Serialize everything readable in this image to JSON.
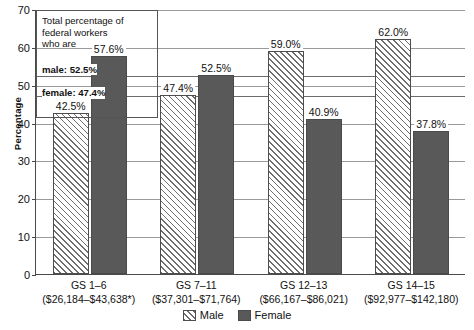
{
  "chart_data": {
    "type": "bar",
    "title": "",
    "xlabel": "",
    "ylabel": "Percentage",
    "ylim": [
      0,
      70
    ],
    "ytick_step": 10,
    "yticks": [
      0,
      10,
      20,
      30,
      40,
      50,
      60,
      70
    ],
    "grid": true,
    "legend_position": "bottom-center",
    "categories": [
      "GS 1–6",
      "GS 7–11",
      "GS 12–13",
      "GS 14–15"
    ],
    "category_sublabels": [
      "($26,184–$43,638*)",
      "($37,301–$71,764)",
      "($66,167–$86,021)",
      "($92,977–$142,180)"
    ],
    "series": [
      {
        "name": "Male",
        "values": [
          42.5,
          47.4,
          59.0,
          62.0
        ],
        "labels": [
          "42.5%",
          "47.4%",
          "59.0%",
          "62.0%"
        ],
        "color": "#ffffff",
        "pattern": "diagonal-hatch"
      },
      {
        "name": "Female",
        "values": [
          57.6,
          52.5,
          40.9,
          37.8
        ],
        "labels": [
          "57.6%",
          "52.5%",
          "40.9%",
          "37.8%"
        ],
        "color": "#595959",
        "pattern": "solid"
      }
    ],
    "reference_lines": [
      {
        "name": "male-total",
        "value": 52.5,
        "label": "male: 52.5%"
      },
      {
        "name": "female-total",
        "value": 47.4,
        "label": "female: 47.4%"
      }
    ],
    "annotation": {
      "line1": "Total percentage of",
      "line2": "federal workers",
      "line3": "who are",
      "male_stat": "male: 52.5%",
      "female_stat": "female: 47.4%"
    }
  },
  "legend": {
    "items": [
      {
        "label": "Male"
      },
      {
        "label": "Female"
      }
    ]
  },
  "colors": {
    "female_bar": "#595959",
    "male_bar_line": "#6e6e6e",
    "axis": "#4a4a4a",
    "gridline": "#9a9a9a",
    "reference_line": "#6b6b6b"
  }
}
